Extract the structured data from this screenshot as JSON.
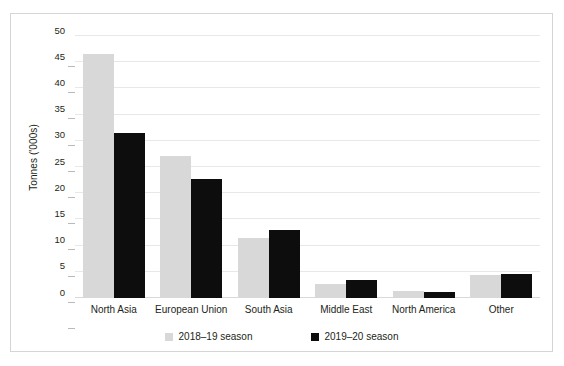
{
  "chart_data": {
    "type": "bar",
    "title": "",
    "subtitle": "",
    "xlabel": "",
    "ylabel": "Tonnes ('000s)",
    "categories": [
      "North Asia",
      "European Union",
      "South Asia",
      "Middle East",
      "North America",
      "Other"
    ],
    "series": [
      {
        "name": "2018–19 season",
        "color": "#d8d8d8",
        "values": [
          46.6,
          27.1,
          11.5,
          2.6,
          1.3,
          4.3
        ]
      },
      {
        "name": "2019–20 season",
        "color": "#0d0d0d",
        "values": [
          31.4,
          22.8,
          13.0,
          3.5,
          1.2,
          4.5
        ]
      }
    ],
    "ylim": [
      0,
      50
    ],
    "ytick_values": [
      50,
      45,
      40,
      35,
      30,
      25,
      20,
      15,
      10,
      5,
      0
    ],
    "ytick_labels": [
      "50",
      "45",
      "40",
      "35",
      "30",
      "25",
      "20",
      "15",
      "10",
      "5",
      "0"
    ],
    "grid": "horizontal",
    "legend_position": "bottom",
    "legend_entries": [
      "2018–19 season",
      "2019–20 season"
    ],
    "annotations": []
  },
  "figure": {
    "border_color": "#d5d5d5",
    "background": "#ffffff",
    "gridline_color": "#e8e8e8",
    "text_color": "#231f20"
  }
}
